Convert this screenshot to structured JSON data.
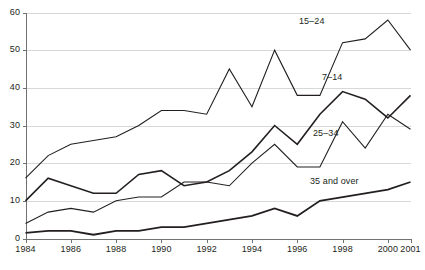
{
  "chart_data": {
    "type": "line",
    "title": "",
    "xlabel": "",
    "ylabel": "",
    "xlim": [
      1984,
      2001
    ],
    "ylim": [
      0,
      60
    ],
    "ytick_values": [
      0,
      10,
      20,
      30,
      40,
      50,
      60
    ],
    "ytick_labels": [
      "0",
      "10",
      "20",
      "30",
      "40",
      "50",
      "60"
    ],
    "xtick_values": [
      1984,
      1986,
      1988,
      1990,
      1992,
      1994,
      1996,
      1998,
      2000,
      2001
    ],
    "xtick_labels": [
      "1984",
      "1986",
      "1988",
      "1990",
      "1992",
      "1994",
      "1996",
      "1998",
      "2000",
      "2001"
    ],
    "grid": "horizontal",
    "legend_position": "inline-annotations",
    "x": [
      1984,
      1985,
      1986,
      1987,
      1988,
      1989,
      1990,
      1991,
      1992,
      1993,
      1994,
      1995,
      1996,
      1997,
      1998,
      1999,
      2000,
      2001
    ],
    "series": [
      {
        "name": "15-24",
        "label": "15–24",
        "color": "#231f20",
        "width": 1.1,
        "values": [
          16,
          22,
          25,
          26,
          27,
          30,
          34,
          34,
          33,
          45,
          35,
          50,
          38,
          38,
          52,
          53,
          58,
          50
        ]
      },
      {
        "name": "7-14",
        "label": "7–14",
        "color": "#231f20",
        "width": 1.6,
        "values": [
          10,
          16,
          14,
          12,
          12,
          17,
          18,
          14,
          15,
          18,
          23,
          30,
          25,
          33,
          39,
          37,
          32,
          38
        ]
      },
      {
        "name": "25-34",
        "label": "25–34",
        "color": "#231f20",
        "width": 1.1,
        "values": [
          4,
          7,
          8,
          7,
          10,
          11,
          11,
          15,
          15,
          14,
          20,
          25,
          19,
          19,
          31,
          24,
          33,
          29
        ]
      },
      {
        "name": "35 and over",
        "label": "35 and over",
        "color": "#231f20",
        "width": 1.8,
        "values": [
          1.5,
          2,
          2,
          1,
          2,
          2,
          3,
          3,
          4,
          5,
          6,
          8,
          6,
          10,
          11,
          12,
          13,
          15
        ]
      }
    ],
    "annotations": [
      {
        "text": "15–24",
        "x_px": 299,
        "y_px": 16
      },
      {
        "text": "7–14",
        "x_px": 322,
        "y_px": 72
      },
      {
        "text": "25–34",
        "x_px": 313,
        "y_px": 128
      },
      {
        "text": "35 and over",
        "x_px": 310,
        "y_px": 176
      }
    ],
    "axis_color": "#6f7173",
    "grid_color": "#d6d8da",
    "background": "#ffffff"
  },
  "caption_sliver": ""
}
